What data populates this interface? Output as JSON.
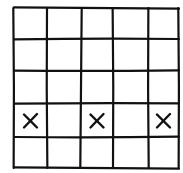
{
  "grid": {
    "rows": 5,
    "cols": 5,
    "line_color": "#111111",
    "background": "#ffffff",
    "x_lines": [
      14,
      47,
      81,
      113,
      148,
      179
    ],
    "y_lines": [
      8,
      39,
      71,
      103,
      137,
      168
    ]
  },
  "marks": [
    {
      "row": 4,
      "col": 1,
      "symbol": "X"
    },
    {
      "row": 4,
      "col": 3,
      "symbol": "X"
    },
    {
      "row": 4,
      "col": 5,
      "symbol": "X"
    }
  ],
  "cells": [
    [
      "",
      "",
      "",
      "",
      ""
    ],
    [
      "",
      "",
      "",
      "",
      ""
    ],
    [
      "",
      "",
      "",
      "",
      ""
    ],
    [
      "X",
      "",
      "X",
      "",
      "X"
    ],
    [
      "",
      "",
      "",
      "",
      ""
    ]
  ]
}
